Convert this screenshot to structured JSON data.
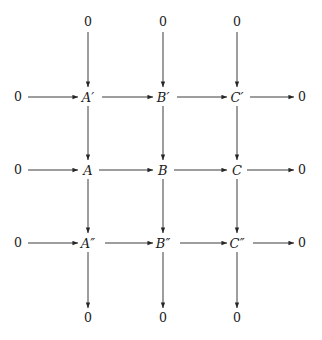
{
  "diagram": {
    "kind": "commutative-diagram",
    "caption": "",
    "background_color": "#ffffff",
    "line_color": "#262626",
    "text_color": "#1a1a1a",
    "grid": {
      "columns_x": [
        18,
        88,
        163,
        237,
        302
      ],
      "rows_y": [
        22,
        97,
        170,
        243,
        318
      ]
    },
    "zeros": {
      "top": [
        "0",
        "0",
        "0"
      ],
      "bottom": [
        "0",
        "0",
        "0"
      ],
      "left": [
        "0",
        "0",
        "0"
      ],
      "right": [
        "0",
        "0",
        "0"
      ]
    },
    "rows": [
      {
        "name": "top-row",
        "nodes": [
          {
            "id": "left-zero-row1",
            "base": "0",
            "prime": "",
            "x": 18,
            "y": 97,
            "kind": "zero"
          },
          {
            "id": "A-prime",
            "base": "A",
            "prime": "′",
            "x": 88,
            "y": 97,
            "kind": "object"
          },
          {
            "id": "B-prime",
            "base": "B",
            "prime": "′",
            "x": 163,
            "y": 97,
            "kind": "object"
          },
          {
            "id": "C-prime",
            "base": "C",
            "prime": "′",
            "x": 237,
            "y": 97,
            "kind": "object"
          },
          {
            "id": "right-zero-row1",
            "base": "0",
            "prime": "",
            "x": 302,
            "y": 97,
            "kind": "zero"
          }
        ]
      },
      {
        "name": "middle-row",
        "nodes": [
          {
            "id": "left-zero-row2",
            "base": "0",
            "prime": "",
            "x": 18,
            "y": 170,
            "kind": "zero"
          },
          {
            "id": "A",
            "base": "A",
            "prime": "",
            "x": 88,
            "y": 170,
            "kind": "object"
          },
          {
            "id": "B",
            "base": "B",
            "prime": "",
            "x": 163,
            "y": 170,
            "kind": "object"
          },
          {
            "id": "C",
            "base": "C",
            "prime": "",
            "x": 237,
            "y": 170,
            "kind": "object"
          },
          {
            "id": "right-zero-row2",
            "base": "0",
            "prime": "",
            "x": 302,
            "y": 170,
            "kind": "zero"
          }
        ]
      },
      {
        "name": "bottom-row",
        "nodes": [
          {
            "id": "left-zero-row3",
            "base": "0",
            "prime": "",
            "x": 18,
            "y": 243,
            "kind": "zero"
          },
          {
            "id": "A-double-prime",
            "base": "A",
            "prime": "″",
            "x": 88,
            "y": 243,
            "kind": "object"
          },
          {
            "id": "B-double-prime",
            "base": "B",
            "prime": "″",
            "x": 163,
            "y": 243,
            "kind": "object"
          },
          {
            "id": "C-double-prime",
            "base": "C",
            "prime": "″",
            "x": 237,
            "y": 243,
            "kind": "object"
          },
          {
            "id": "right-zero-row3",
            "base": "0",
            "prime": "",
            "x": 302,
            "y": 243,
            "kind": "zero"
          }
        ]
      }
    ],
    "column_caps": [
      {
        "id": "top-zero-col-A",
        "base": "0",
        "x": 88,
        "y": 22
      },
      {
        "id": "top-zero-col-B",
        "base": "0",
        "x": 163,
        "y": 22
      },
      {
        "id": "top-zero-col-C",
        "base": "0",
        "x": 237,
        "y": 22
      },
      {
        "id": "bottom-zero-col-A",
        "base": "0",
        "x": 88,
        "y": 318
      },
      {
        "id": "bottom-zero-col-B",
        "base": "0",
        "x": 163,
        "y": 318
      },
      {
        "id": "bottom-zero-col-C",
        "base": "0",
        "x": 237,
        "y": 318
      }
    ],
    "arrows": {
      "horizontal": [
        {
          "id": "h-0-to-Aprime",
          "from": "left-zero-row1",
          "to": "A-prime",
          "x1": 28,
          "y1": 97,
          "x2": 78,
          "y2": 97
        },
        {
          "id": "h-Aprime-to-Bprime",
          "from": "A-prime",
          "to": "B-prime",
          "x1": 102,
          "y1": 97,
          "x2": 153,
          "y2": 97
        },
        {
          "id": "h-Bprime-to-Cprime",
          "from": "B-prime",
          "to": "C-prime",
          "x1": 177,
          "y1": 97,
          "x2": 227,
          "y2": 97
        },
        {
          "id": "h-Cprime-to-0",
          "from": "C-prime",
          "to": "right-zero-row1",
          "x1": 250,
          "y1": 97,
          "x2": 294,
          "y2": 97
        },
        {
          "id": "h-0-to-A",
          "from": "left-zero-row2",
          "to": "A",
          "x1": 28,
          "y1": 170,
          "x2": 78,
          "y2": 170
        },
        {
          "id": "h-A-to-B",
          "from": "A",
          "to": "B",
          "x1": 99,
          "y1": 170,
          "x2": 153,
          "y2": 170
        },
        {
          "id": "h-B-to-C",
          "from": "B",
          "to": "C",
          "x1": 174,
          "y1": 170,
          "x2": 227,
          "y2": 170
        },
        {
          "id": "h-C-to-0",
          "from": "C",
          "to": "right-zero-row2",
          "x1": 247,
          "y1": 170,
          "x2": 294,
          "y2": 170
        },
        {
          "id": "h-0-to-Adoubleprime",
          "from": "left-zero-row3",
          "to": "A-double-prime",
          "x1": 28,
          "y1": 243,
          "x2": 78,
          "y2": 243
        },
        {
          "id": "h-Adoubleprime-to-Bdoubleprime",
          "from": "A-double-prime",
          "to": "B-double-prime",
          "x1": 105,
          "y1": 243,
          "x2": 153,
          "y2": 243
        },
        {
          "id": "h-Bdoubleprime-to-Cdoubleprime",
          "from": "B-double-prime",
          "to": "C-double-prime",
          "x1": 180,
          "y1": 243,
          "x2": 227,
          "y2": 243
        },
        {
          "id": "h-Cdoubleprime-to-0",
          "from": "C-double-prime",
          "to": "right-zero-row3",
          "x1": 253,
          "y1": 243,
          "x2": 294,
          "y2": 243
        }
      ],
      "vertical": [
        {
          "id": "v-0-to-Aprime",
          "from": "top-zero-col-A",
          "to": "A-prime",
          "x1": 88,
          "y1": 32,
          "x2": 88,
          "y2": 87
        },
        {
          "id": "v-0-to-Bprime",
          "from": "top-zero-col-B",
          "to": "B-prime",
          "x1": 163,
          "y1": 32,
          "x2": 163,
          "y2": 87
        },
        {
          "id": "v-0-to-Cprime",
          "from": "top-zero-col-C",
          "to": "C-prime",
          "x1": 237,
          "y1": 32,
          "x2": 237,
          "y2": 87
        },
        {
          "id": "v-Aprime-to-A",
          "from": "A-prime",
          "to": "A",
          "x1": 88,
          "y1": 106,
          "x2": 88,
          "y2": 160
        },
        {
          "id": "v-Bprime-to-B",
          "from": "B-prime",
          "to": "B",
          "x1": 163,
          "y1": 106,
          "x2": 163,
          "y2": 160
        },
        {
          "id": "v-Cprime-to-C",
          "from": "C-prime",
          "to": "C",
          "x1": 237,
          "y1": 106,
          "x2": 237,
          "y2": 160
        },
        {
          "id": "v-A-to-Adoubleprime",
          "from": "A",
          "to": "A-double-prime",
          "x1": 88,
          "y1": 179,
          "x2": 88,
          "y2": 233
        },
        {
          "id": "v-B-to-Bdoubleprime",
          "from": "B",
          "to": "B-double-prime",
          "x1": 163,
          "y1": 179,
          "x2": 163,
          "y2": 233
        },
        {
          "id": "v-C-to-Cdoubleprime",
          "from": "C",
          "to": "C-double-prime",
          "x1": 237,
          "y1": 179,
          "x2": 237,
          "y2": 233
        },
        {
          "id": "v-Adoubleprime-to-0",
          "from": "A-double-prime",
          "to": "bottom-zero-col-A",
          "x1": 88,
          "y1": 252,
          "x2": 88,
          "y2": 308
        },
        {
          "id": "v-Bdoubleprime-to-0",
          "from": "B-double-prime",
          "to": "bottom-zero-col-B",
          "x1": 163,
          "y1": 252,
          "x2": 163,
          "y2": 308
        },
        {
          "id": "v-Cdoubleprime-to-0",
          "from": "C-double-prime",
          "to": "bottom-zero-col-C",
          "x1": 237,
          "y1": 252,
          "x2": 237,
          "y2": 308
        }
      ]
    }
  }
}
